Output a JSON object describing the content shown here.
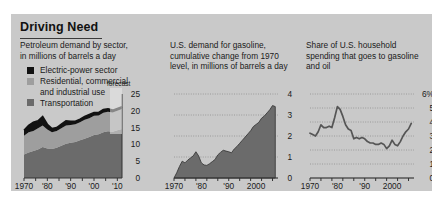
{
  "figure": {
    "title": "Driving Need",
    "background_color": "#c9c9c9"
  },
  "panels": [
    {
      "id": "petroleum-demand-by-sector",
      "subtitle": "Petroleum demand by sector,\nin millions of barrels a day",
      "annotation": "forecast",
      "legend": [
        {
          "label": "Electric-power sector",
          "color": "#121212"
        },
        {
          "label": "Residential, commercial\nand industrial use",
          "color": "#9e9e9e"
        },
        {
          "label": "Transportation",
          "color": "#6b6b6b"
        }
      ]
    },
    {
      "id": "gasoline-cumulative-change",
      "subtitle": "U.S. demand for gasoline,\ncumulative change from 1970\nlevel, in millions of barrels a day"
    },
    {
      "id": "household-spending-share",
      "subtitle": "Share of U.S. household\nspending that goes to gasoline\nand oil"
    }
  ],
  "chart_data": [
    {
      "type": "area",
      "id": "petroleum-demand-by-sector",
      "title": "Petroleum demand by sector, in millions of barrels a day",
      "xlabel": "",
      "ylabel": "millions of barrels a day",
      "xlim": [
        1970,
        2012
      ],
      "ylim": [
        0,
        25
      ],
      "xticks": [
        1970,
        1980,
        1990,
        2000,
        2010
      ],
      "xticklabels": [
        "1970",
        "'80",
        "'90",
        "'00",
        "'10"
      ],
      "yticks": [
        0,
        5,
        10,
        15,
        20,
        25
      ],
      "yticklabels": [
        "0",
        "5",
        "10",
        "15",
        "20",
        "25"
      ],
      "grid": false,
      "stacked": true,
      "annotation": "forecast",
      "forecast_start": 2007,
      "x": [
        1970,
        1972,
        1974,
        1976,
        1978,
        1980,
        1982,
        1984,
        1986,
        1988,
        1990,
        1992,
        1994,
        1996,
        1998,
        2000,
        2002,
        2004,
        2006,
        2008,
        2010,
        2012
      ],
      "series": [
        {
          "name": "Transportation",
          "color": "#6b6b6b",
          "values": [
            7.0,
            7.6,
            8.0,
            8.5,
            9.2,
            8.8,
            8.6,
            9.0,
            9.6,
            10.2,
            10.5,
            10.7,
            11.2,
            11.7,
            12.2,
            12.8,
            13.0,
            13.6,
            13.9,
            13.8,
            14.2,
            14.6
          ]
        },
        {
          "name": "Residential, commercial and industrial use",
          "color": "#9e9e9e",
          "values": [
            5.6,
            6.0,
            6.0,
            6.3,
            6.4,
            5.6,
            5.0,
            5.0,
            5.2,
            5.4,
            5.3,
            5.3,
            5.4,
            5.6,
            5.6,
            5.7,
            5.6,
            5.8,
            5.8,
            5.7,
            5.8,
            5.9
          ]
        },
        {
          "name": "Electric-power sector",
          "color": "#121212",
          "values": [
            1.6,
            2.1,
            2.6,
            2.2,
            2.7,
            1.6,
            1.1,
            1.0,
            1.2,
            1.4,
            1.1,
            0.9,
            0.9,
            1.0,
            1.1,
            1.0,
            0.9,
            1.0,
            0.9,
            0.7,
            0.7,
            0.7
          ]
        }
      ]
    },
    {
      "type": "area",
      "id": "gasoline-cumulative-change",
      "title": "U.S. demand for gasoline, cumulative change from 1970 level, in millions of barrels a day",
      "xlabel": "",
      "ylabel": "millions of barrels a day",
      "xlim": [
        1970,
        2008
      ],
      "ylim": [
        0,
        4
      ],
      "xticks": [
        1970,
        1980,
        1990,
        2000
      ],
      "xticklabels": [
        "1970",
        "'80",
        "'90",
        "2000"
      ],
      "yticks": [
        0,
        1,
        2,
        3,
        4
      ],
      "yticklabels": [
        "0",
        "1",
        "2",
        "3",
        "4"
      ],
      "grid": true,
      "color": "#6b6b6b",
      "x": [
        1970,
        1971,
        1972,
        1973,
        1974,
        1975,
        1976,
        1977,
        1978,
        1979,
        1980,
        1981,
        1982,
        1983,
        1984,
        1985,
        1986,
        1987,
        1988,
        1989,
        1990,
        1991,
        1992,
        1993,
        1994,
        1995,
        1996,
        1997,
        1998,
        1999,
        2000,
        2001,
        2002,
        2003,
        2004,
        2005,
        2006,
        2007
      ],
      "values": [
        0.0,
        0.25,
        0.55,
        0.8,
        0.72,
        0.85,
        0.95,
        1.05,
        1.25,
        1.05,
        0.72,
        0.62,
        0.6,
        0.68,
        0.78,
        0.88,
        1.1,
        1.22,
        1.32,
        1.28,
        1.25,
        1.2,
        1.38,
        1.5,
        1.65,
        1.8,
        1.95,
        2.1,
        2.25,
        2.45,
        2.55,
        2.65,
        2.85,
        2.95,
        3.1,
        3.25,
        3.45,
        3.4
      ]
    },
    {
      "type": "line",
      "id": "household-spending-share",
      "title": "Share of U.S. household spending that goes to gasoline and oil",
      "xlabel": "",
      "ylabel": "percent",
      "xlim": [
        1970,
        2008
      ],
      "ylim": [
        0,
        6
      ],
      "xticks": [
        1970,
        1980,
        1990,
        2000
      ],
      "xticklabels": [
        "1970",
        "'80",
        "'90",
        "2000"
      ],
      "yticks": [
        0,
        1,
        2,
        3,
        4,
        5,
        6
      ],
      "yticklabels": [
        "0",
        "1",
        "2",
        "3",
        "4",
        "5",
        "6%"
      ],
      "grid": true,
      "color": "#555555",
      "x": [
        1970,
        1971,
        1972,
        1973,
        1974,
        1975,
        1976,
        1977,
        1978,
        1979,
        1980,
        1981,
        1982,
        1983,
        1984,
        1985,
        1986,
        1987,
        1988,
        1989,
        1990,
        1991,
        1992,
        1993,
        1994,
        1995,
        1996,
        1997,
        1998,
        1999,
        2000,
        2001,
        2002,
        2003,
        2004,
        2005,
        2006,
        2007
      ],
      "values": [
        3.2,
        3.1,
        3.0,
        3.3,
        3.8,
        3.6,
        3.6,
        3.7,
        3.6,
        4.3,
        5.1,
        4.9,
        4.4,
        3.8,
        3.5,
        3.4,
        2.8,
        2.9,
        2.8,
        2.9,
        2.8,
        2.6,
        2.5,
        2.5,
        2.4,
        2.4,
        2.5,
        2.4,
        2.1,
        2.3,
        2.7,
        2.4,
        2.3,
        2.6,
        3.0,
        3.3,
        3.5,
        3.9
      ]
    }
  ]
}
